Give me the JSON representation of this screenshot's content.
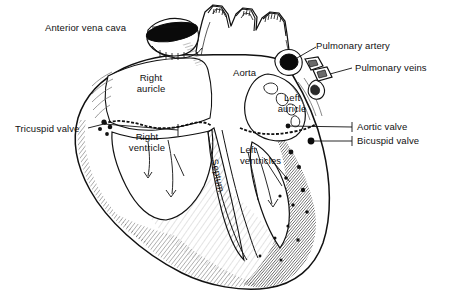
{
  "figure": {
    "type": "anatomical-line-diagram",
    "background_color": "#ffffff",
    "ink_color": "#111111"
  },
  "labels": {
    "anterior_vena_cava": "Anterior vena cava",
    "tricuspid_valve": "Tricuspid valve",
    "right_auricle_line1": "Right",
    "right_auricle_line2": "auricle",
    "right_ventricle_line1": "Right",
    "right_ventricle_line2": "ventricle",
    "aorta": "Aorta",
    "septum": "Septum",
    "pulmonary_artery": "Pulmonary artery",
    "pulmonary_veins": "Pulmonary veins",
    "left_auricle_line1": "Left",
    "left_auricle_line2": "auricle",
    "aortic_valve": "Aortic valve",
    "bicuspid_valve": "Bicuspid valve",
    "left_ventricles_line1": "Left",
    "left_ventricles_line2": "ventricles"
  }
}
